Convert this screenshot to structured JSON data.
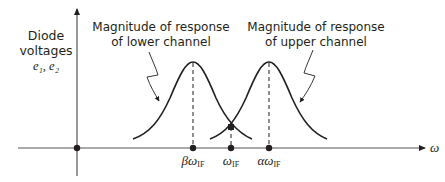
{
  "diagram": {
    "y_axis_label": {
      "line1": "Diode",
      "line2": "voltages",
      "symbols": "e₁, e₂"
    },
    "x_axis_label": "ω",
    "annotations": {
      "lower": {
        "line1": "Magnitude of response",
        "line2": "of lower channel"
      },
      "upper": {
        "line1": "Magnitude of response",
        "line2": "of upper channel"
      }
    },
    "ticks": [
      {
        "prefix": "βω",
        "sub": "IF"
      },
      {
        "prefix": "ω",
        "sub": "IF"
      },
      {
        "prefix": "αω",
        "sub": "IF"
      }
    ],
    "colors": {
      "stroke": "#231f20",
      "axis": "#555555",
      "background": "#ffffff"
    }
  }
}
